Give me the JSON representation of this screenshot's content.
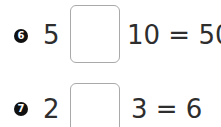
{
  "problems": [
    {
      "number": "6",
      "left_operand": "5",
      "answer_box": "",
      "right_side": "10 = 50"
    },
    {
      "number": "7",
      "left_operand": "2",
      "answer_box": "",
      "right_side": "3 = 6"
    }
  ]
}
